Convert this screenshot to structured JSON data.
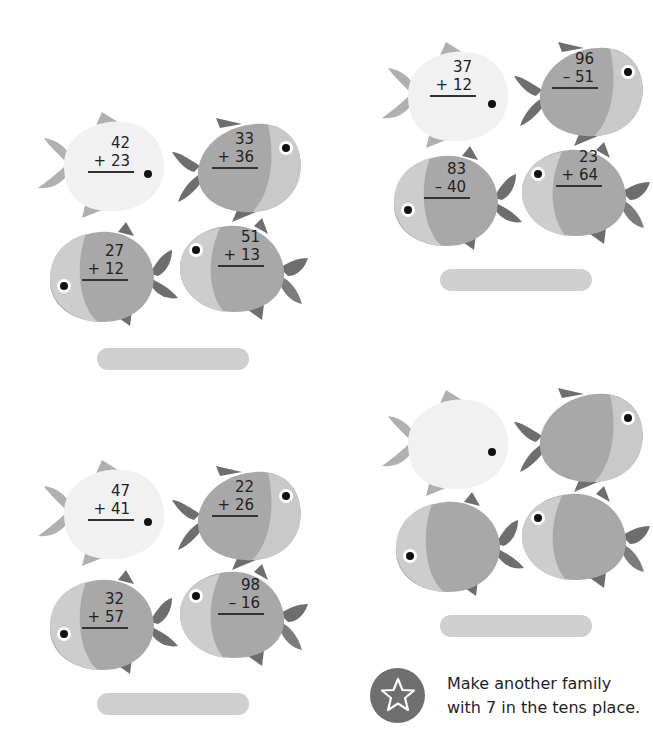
{
  "families": [
    {
      "id": "family-1",
      "problems": [
        {
          "top": "42",
          "op": "+",
          "bottom": "23"
        },
        {
          "top": "33",
          "op": "+",
          "bottom": "36"
        },
        {
          "top": "27",
          "op": "+",
          "bottom": "12"
        },
        {
          "top": "51",
          "op": "+",
          "bottom": "13"
        }
      ],
      "answer": ""
    },
    {
      "id": "family-2",
      "problems": [
        {
          "top": "37",
          "op": "+",
          "bottom": "12"
        },
        {
          "top": "96",
          "op": "–",
          "bottom": "51"
        },
        {
          "top": "83",
          "op": "–",
          "bottom": "40"
        },
        {
          "top": "23",
          "op": "+",
          "bottom": "64"
        }
      ],
      "answer": ""
    },
    {
      "id": "family-3",
      "problems": [
        {
          "top": "47",
          "op": "+",
          "bottom": "41"
        },
        {
          "top": "22",
          "op": "+",
          "bottom": "26"
        },
        {
          "top": "32",
          "op": "+",
          "bottom": "57"
        },
        {
          "top": "98",
          "op": "–",
          "bottom": "16"
        }
      ],
      "answer": ""
    },
    {
      "id": "family-4-blank",
      "problems": [],
      "answer": ""
    }
  ],
  "challenge": {
    "icon": "star-icon",
    "line1": "Make another family",
    "line2": "with 7 in the tens place."
  },
  "colors": {
    "fish_light": "#f0f0f0",
    "fish_mid": "#b5b5b5",
    "fish_dark": "#9a9a9a",
    "fin_light": "#b0b0b0",
    "fin_dark": "#6e6e6e",
    "answer_bar": "#cfcfcf",
    "star_badge": "#6f6f6f"
  },
  "texts": {
    "f1p0_top": "42",
    "f1p0_bot": "+ 23",
    "f1p1_top": "33",
    "f1p1_bot": "+ 36",
    "f1p2_top": "27",
    "f1p2_bot": "+ 12",
    "f1p3_top": "51",
    "f1p3_bot": "+ 13",
    "f2p0_top": "37",
    "f2p0_bot": "+ 12",
    "f2p1_top": "96",
    "f2p1_bot": "– 51",
    "f2p2_top": "83",
    "f2p2_bot": "– 40",
    "f2p3_top": "23",
    "f2p3_bot": "+ 64",
    "f3p0_top": "47",
    "f3p0_bot": "+ 41",
    "f3p1_top": "22",
    "f3p1_bot": "+ 26",
    "f3p2_top": "32",
    "f3p2_bot": "+ 57",
    "f3p3_top": "98",
    "f3p3_bot": "– 16"
  }
}
